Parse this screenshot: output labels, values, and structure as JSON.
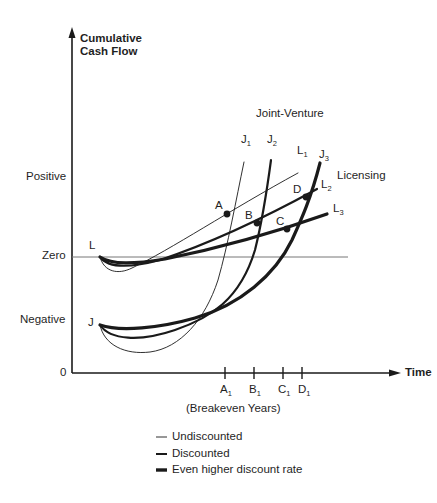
{
  "diagram": {
    "y_axis_label_line1": "Cumulative",
    "y_axis_label_line2": "Cash Flow",
    "x_axis_label": "Time",
    "y_levels": {
      "positive": "Positive",
      "zero": "Zero",
      "negative": "Negative",
      "origin": "0"
    },
    "series_groups": {
      "joint_venture": "Joint-Venture",
      "licensing": "Licensing"
    },
    "curve_starts": {
      "licensing": "L",
      "joint_venture": "J"
    },
    "curve_labels": [
      {
        "base": "J",
        "sub": "1"
      },
      {
        "base": "J",
        "sub": "2"
      },
      {
        "base": "L",
        "sub": "1"
      },
      {
        "base": "J",
        "sub": "3"
      },
      {
        "base": "L",
        "sub": "2"
      },
      {
        "base": "L",
        "sub": "3"
      }
    ],
    "intersection_points": [
      "A",
      "B",
      "C",
      "D"
    ],
    "x_ticks": [
      {
        "base": "A",
        "sub": "1"
      },
      {
        "base": "B",
        "sub": "1"
      },
      {
        "base": "C",
        "sub": "1"
      },
      {
        "base": "D",
        "sub": "1"
      }
    ],
    "x_ticks_caption": "(Breakeven Years)",
    "legend": [
      {
        "label": "Undiscounted",
        "weight": "thin"
      },
      {
        "label": "Discounted",
        "weight": "medium"
      },
      {
        "label": "Even higher discount rate",
        "weight": "thick"
      }
    ],
    "colors": {
      "ink": "#1a1a1a",
      "zero_line": "#777777",
      "background": "#ffffff"
    }
  }
}
